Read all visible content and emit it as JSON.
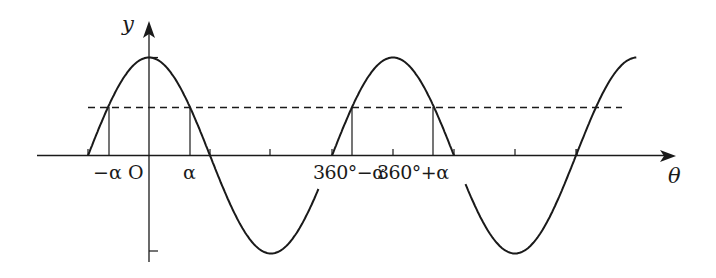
{
  "figure": {
    "colors": {
      "curve": "#1a1a1a",
      "axis": "#1a1a1a",
      "background": "#ffffff"
    },
    "axes": {
      "x_label": "θ",
      "y_label": "y"
    },
    "tick_labels": {
      "neg_alpha": "−α",
      "origin": "O",
      "alpha": "α",
      "three_sixty_minus_alpha": "360°−α",
      "three_sixty_plus_alpha": "360°+α"
    },
    "reference_line": {
      "style": "dashed",
      "meaning": "y = k (0 < k < 1)"
    }
  },
  "chart_data": {
    "type": "line",
    "title": "",
    "xlabel": "θ",
    "ylabel": "y",
    "function": "y = cos θ",
    "x_range_deg": [
      -90,
      720
    ],
    "y_range": [
      -1,
      1
    ],
    "x_ticks_deg": [
      90,
      180,
      270,
      360,
      450,
      540,
      630
    ],
    "y_ticks": [
      1,
      -1
    ],
    "dashed_line_y": 0.5,
    "marked_points_deg": [
      "-α",
      "α",
      "360°-α",
      "360°+α"
    ],
    "annotations": [
      "−α",
      "O",
      "α",
      "360°−α",
      "360°+α"
    ],
    "grid": false
  }
}
